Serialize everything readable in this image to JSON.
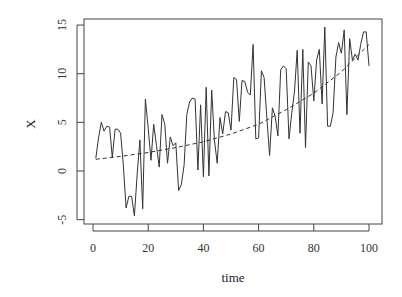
{
  "chart_data": {
    "type": "line",
    "title": "",
    "xlabel": "time",
    "ylabel": "X",
    "xlim": [
      -3,
      103
    ],
    "ylim": [
      -5.5,
      15.5
    ],
    "x_ticks": [
      0,
      20,
      40,
      60,
      80,
      100
    ],
    "y_ticks": [
      -5,
      0,
      5,
      10,
      15
    ],
    "grid": false,
    "legend": null,
    "series": [
      {
        "name": "X",
        "style": "solid",
        "color": "#333333",
        "x": [
          1,
          2,
          3,
          4,
          5,
          6,
          7,
          8,
          9,
          10,
          11,
          12,
          13,
          14,
          15,
          16,
          17,
          18,
          19,
          20,
          21,
          22,
          23,
          24,
          25,
          26,
          27,
          28,
          29,
          30,
          31,
          32,
          33,
          34,
          35,
          36,
          37,
          38,
          39,
          40,
          41,
          42,
          43,
          44,
          45,
          46,
          47,
          48,
          49,
          50,
          51,
          52,
          53,
          54,
          55,
          56,
          57,
          58,
          59,
          60,
          61,
          62,
          63,
          64,
          65,
          66,
          67,
          68,
          69,
          70,
          71,
          72,
          73,
          74,
          75,
          76,
          77,
          78,
          79,
          80,
          81,
          82,
          83,
          84,
          85,
          86,
          87,
          88,
          89,
          90,
          91,
          92,
          93,
          94,
          95,
          96,
          97,
          98,
          99,
          100
        ],
        "values": [
          1.3,
          3.4,
          5.0,
          4.1,
          4.6,
          4.5,
          1.4,
          4.3,
          4.3,
          3.9,
          0.5,
          -3.8,
          -2.6,
          -2.6,
          -4.6,
          -0.3,
          3.2,
          -3.9,
          7.4,
          4.4,
          1.1,
          4.8,
          2.6,
          0.4,
          5.8,
          4.8,
          0.8,
          3.5,
          2.6,
          2.9,
          -2.0,
          -1.4,
          0.6,
          5.8,
          7.1,
          7.5,
          7.4,
          0.1,
          6.8,
          -0.6,
          8.6,
          -0.5,
          8.3,
          3.2,
          0.8,
          5.5,
          3.8,
          6.1,
          6.0,
          4.2,
          9.6,
          9.4,
          5.1,
          9.3,
          9.2,
          8.1,
          7.8,
          13.0,
          3.3,
          3.4,
          10.3,
          9.6,
          5.4,
          1.6,
          6.5,
          5.6,
          3.6,
          10.4,
          10.8,
          10.5,
          3.3,
          5.9,
          8.2,
          12.4,
          3.9,
          12.5,
          2.4,
          11.2,
          10.8,
          7.2,
          11.4,
          12.5,
          6.9,
          14.8,
          4.6,
          4.6,
          6.0,
          11.7,
          13.2,
          12.1,
          14.5,
          5.8,
          13.6,
          11.4,
          12.0,
          11.4,
          13.0,
          14.3,
          14.3,
          10.8
        ]
      },
      {
        "name": "trend",
        "style": "dashed",
        "color": "#333333",
        "x": [
          1,
          10,
          20,
          30,
          40,
          50,
          60,
          70,
          80,
          90,
          100
        ],
        "values": [
          1.2,
          1.5,
          1.9,
          2.4,
          3.0,
          3.8,
          4.8,
          6.3,
          8.0,
          10.2,
          13.0
        ]
      }
    ]
  },
  "axes": {
    "xlabel": "time",
    "ylabel": "X",
    "x_tick_labels": [
      "0",
      "20",
      "40",
      "60",
      "80",
      "100"
    ],
    "y_tick_labels": [
      "-5",
      "0",
      "5",
      "10",
      "15"
    ]
  }
}
